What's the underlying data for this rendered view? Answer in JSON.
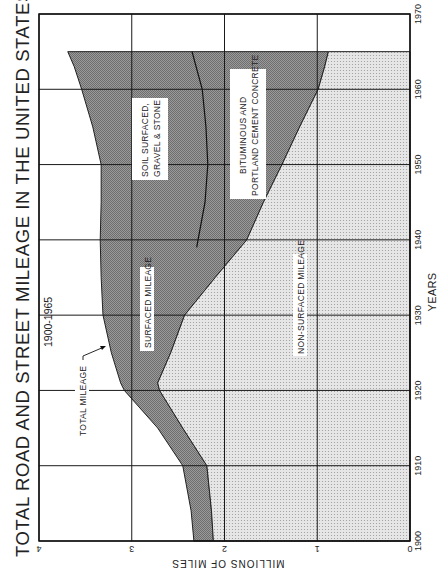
{
  "chart_data": {
    "type": "area",
    "title": "TOTAL ROAD AND STREET MILEAGE IN THE UNITED STATES",
    "subtitle": "1900-1965",
    "xlabel": "YEARS",
    "ylabel": "MILLIONS OF MILES",
    "orientation": "rotated 90° counter-clockwise (years run bottom-to-top, miles increase right-to-left)",
    "x_ticks": [
      1900,
      1910,
      1920,
      1930,
      1940,
      1950,
      1960,
      1970
    ],
    "y_ticks": [
      0,
      1,
      2,
      3,
      4
    ],
    "xlim": [
      1900,
      1970
    ],
    "ylim": [
      0,
      4
    ],
    "grid": true,
    "x": [
      1900,
      1904,
      1910,
      1915,
      1920,
      1921,
      1925,
      1930,
      1935,
      1940,
      1945,
      1950,
      1955,
      1960,
      1963,
      1965
    ],
    "series": [
      {
        "name": "Total Mileage",
        "values": [
          2.33,
          2.36,
          2.45,
          2.72,
          3.08,
          3.12,
          3.22,
          3.31,
          3.33,
          3.34,
          3.33,
          3.33,
          3.42,
          3.54,
          3.62,
          3.69
        ]
      },
      {
        "name": "Non-Surfaced Mileage",
        "values": [
          2.12,
          2.14,
          2.19,
          2.45,
          2.7,
          2.72,
          2.58,
          2.43,
          2.1,
          1.76,
          1.58,
          1.38,
          1.19,
          0.99,
          0.92,
          0.88
        ]
      },
      {
        "name": "Surfaced Mileage",
        "values": [
          0.21,
          0.22,
          0.26,
          0.27,
          0.38,
          0.4,
          0.64,
          0.88,
          1.23,
          1.58,
          1.75,
          1.95,
          2.23,
          2.55,
          2.7,
          2.81
        ]
      }
    ],
    "surfaced_split": {
      "x": [
        1939,
        1945,
        1950,
        1955,
        1960,
        1965
      ],
      "divider_miles": [
        2.3,
        2.21,
        2.18,
        2.2,
        2.24,
        2.35
      ],
      "upper_band": "SOIL SURFACED, GRAVEL & STONE",
      "lower_band": "BITUMINOUS AND PORTLAND CEMENT CONCRETE"
    },
    "annotations": [
      "TOTAL MILEAGE",
      "SURFACED MILEAGE",
      "NON-SURFACED MILEAGE",
      "SOIL SURFACED, GRAVEL & STONE",
      "BITUMINOUS AND PORTLAND CEMENT CONCRETE"
    ]
  },
  "labels": {
    "title": "TOTAL ROAD AND STREET MILEAGE IN THE UNITED STATES",
    "subtitle": "1900-1965",
    "years_axis": "YEARS",
    "miles_axis": "MILLIONS OF MILES",
    "total_mileage": "TOTAL MILEAGE",
    "surfaced_mileage": "SURFACED MILEAGE",
    "non_surfaced_mileage": "NON-SURFACED MILEAGE",
    "soil_line1": "SOIL SURFACED,",
    "soil_line2": "GRAVEL & STONE",
    "bit_line1": "BITUMINOUS AND",
    "bit_line2": "PORTLAND CEMENT CONCRETE"
  },
  "colors": {
    "surfaced_fill": "#8c8c8c",
    "non_surfaced_fill": "#e2e2e2",
    "grid": "#1a1a1a",
    "background": "#ffffff"
  }
}
